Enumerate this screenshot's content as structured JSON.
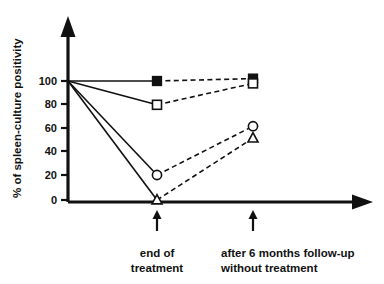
{
  "chart_data": {
    "type": "line",
    "title": "",
    "xlabel": "",
    "ylabel": "% of spleen-culture positivity",
    "ylim": [
      0,
      110
    ],
    "yticks": [
      0,
      20,
      40,
      60,
      80,
      100
    ],
    "ytick_labels": [
      "0",
      "20",
      "40",
      "60",
      "80",
      "100"
    ],
    "grid": false,
    "legend": "none",
    "categories": [
      "baseline",
      "end of treatment",
      "after 6 months follow-up without treatment"
    ],
    "category_labels": [
      "",
      {
        "line1": "end of",
        "line2": "treatment"
      },
      {
        "line1": "after 6 months follow-up",
        "line2": "without treatment"
      }
    ],
    "series": [
      {
        "name": "filled-square",
        "marker": "filled-square",
        "values": [
          100,
          100,
          102
        ]
      },
      {
        "name": "open-square",
        "marker": "open-square",
        "values": [
          100,
          80,
          98
        ]
      },
      {
        "name": "open-circle",
        "marker": "open-circle",
        "values": [
          100,
          21,
          62
        ]
      },
      {
        "name": "open-triangle",
        "marker": "open-triangle",
        "values": [
          100,
          0,
          52
        ]
      }
    ],
    "line_styles": [
      "solid",
      "dashed"
    ],
    "colors": {
      "ink": "#111111",
      "background": "#ffffff"
    }
  },
  "axes": {
    "y_title": "% of spleen-culture positivity",
    "y_ticks": [
      "100",
      "80",
      "60",
      "40",
      "20",
      "0"
    ]
  },
  "x_labels": {
    "first_line1": "end of",
    "first_line2": "treatment",
    "second_line1": "after 6 months follow-up",
    "second_line2": "without treatment"
  }
}
